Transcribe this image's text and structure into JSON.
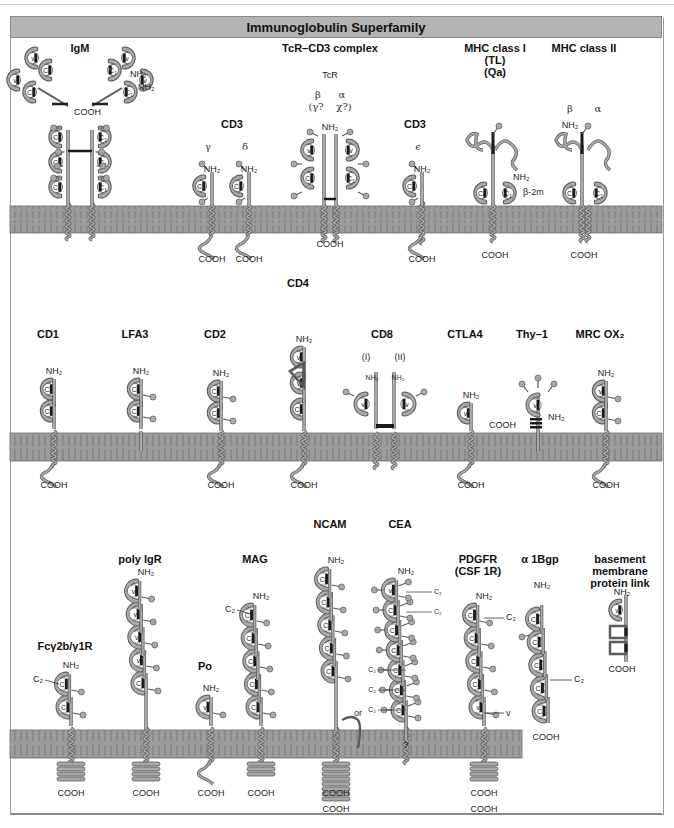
{
  "title": "Immunoglobulin Superfamily",
  "colors": {
    "membrane": "#9c9c9c",
    "membrane_line": "#6e6e6e",
    "chain": "#a8a8a8",
    "chain_outline": "#5a5a5a",
    "disulfide": "#1a1a1a",
    "title_bar": "#b4b4b4"
  },
  "terminal_labels": {
    "n": "NH₂",
    "c": "COOH"
  },
  "rows": [
    {
      "membrane": {
        "x": 10,
        "y": 206,
        "w": 652,
        "h": 27
      },
      "molecules": [
        {
          "id": "igm",
          "name": "IgM",
          "x": 80,
          "label_y": 52,
          "annotations": [
            "NH₂",
            "NH₂",
            "COOH"
          ],
          "domains": [
            "V",
            "V",
            "V",
            "V",
            "C1",
            "C1",
            "C1",
            "C1",
            "C1",
            "C1",
            "C1",
            "C1",
            "C1",
            "C1",
            "C1",
            "C1"
          ]
        },
        {
          "id": "cd3-gamma-delta",
          "name": "CD3",
          "x": 232,
          "label_y": 128,
          "chains": [
            {
              "greek": "γ",
              "x": 208,
              "domains": [
                "C2"
              ]
            },
            {
              "greek": "δ",
              "x": 245,
              "domains": [
                "C2"
              ]
            }
          ]
        },
        {
          "id": "tcr-cd3",
          "name": "TcR–CD3 complex",
          "x": 330,
          "label_y": 52,
          "sublabel": "TcR",
          "greek": [
            "β",
            "α"
          ],
          "greek_alt": [
            "(γ?",
            "χ?)"
          ],
          "domains": [
            "V",
            "V",
            "C1",
            "C1"
          ]
        },
        {
          "id": "cd3-epsilon",
          "name": "CD3",
          "x": 415,
          "label_y": 128,
          "chains": [
            {
              "greek": "ϵ",
              "x": 418,
              "domains": [
                "C2"
              ]
            }
          ]
        },
        {
          "id": "mhc-class-i",
          "name": "MHC class I",
          "name_lines": [
            "MHC class I",
            "(TL)",
            "(Qa)"
          ],
          "x": 495,
          "label_y": 52,
          "domains": [
            "C1",
            "C1"
          ],
          "annotations": [
            "NH₂",
            "β-2m"
          ]
        },
        {
          "id": "mhc-class-ii",
          "name": "MHC class II",
          "x": 584,
          "label_y": 52,
          "greek": [
            "β",
            "α"
          ],
          "domains": [
            "C1",
            "C1"
          ]
        }
      ]
    },
    {
      "membrane": {
        "x": 10,
        "y": 433,
        "w": 652,
        "h": 28
      },
      "molecules": [
        {
          "id": "cd1",
          "name": "CD1",
          "x": 48,
          "label_y": 338,
          "domains": [
            "C1",
            "C1"
          ]
        },
        {
          "id": "lfa3",
          "name": "LFA3",
          "x": 135,
          "label_y": 338,
          "domains": [
            "C1",
            "C1"
          ]
        },
        {
          "id": "cd2",
          "name": "CD2",
          "x": 215,
          "label_y": 338,
          "domains": [
            "C2",
            "C2"
          ]
        },
        {
          "id": "cd4",
          "name": "CD4",
          "x": 298,
          "label_y": 287,
          "domains": [
            "V",
            "V",
            "C2"
          ]
        },
        {
          "id": "cd8",
          "name": "CD8",
          "x": 382,
          "label_y": 338,
          "chain_labels": [
            "(I)",
            "(II)"
          ],
          "domains": [
            "V",
            "V"
          ]
        },
        {
          "id": "ctla4",
          "name": "CTLA4",
          "x": 465,
          "label_y": 338,
          "domains": [
            "V"
          ]
        },
        {
          "id": "thy1",
          "name": "Thy–1",
          "x": 532,
          "label_y": 338,
          "domains": [
            "V"
          ]
        },
        {
          "id": "mrc-ox2",
          "name": "MRC OX₂",
          "x": 600,
          "label_y": 338,
          "domains": [
            "V",
            "C2"
          ]
        }
      ]
    },
    {
      "membrane": {
        "x": 10,
        "y": 730,
        "w": 512,
        "h": 28
      },
      "molecules": [
        {
          "id": "fcg2b-g1r",
          "name": "Fcγ2b/γ1R",
          "x": 65,
          "label_y": 650,
          "domains": [
            "C2",
            "C2"
          ]
        },
        {
          "id": "poly-igr",
          "name": "poly IgR",
          "x": 140,
          "label_y": 563,
          "domains": [
            "V",
            "V",
            "V",
            "V",
            "C2"
          ]
        },
        {
          "id": "po",
          "name": "Po",
          "x": 205,
          "label_y": 670,
          "domains": [
            "V"
          ]
        },
        {
          "id": "mag",
          "name": "MAG",
          "x": 255,
          "label_y": 563,
          "domains": [
            "C2",
            "C2",
            "C2",
            "C2",
            "C2"
          ]
        },
        {
          "id": "ncam",
          "name": "NCAM",
          "x": 330,
          "label_y": 528,
          "domains": [
            "C2",
            "C2",
            "C2",
            "C2",
            "C2"
          ],
          "annotation": "or"
        },
        {
          "id": "cea",
          "name": "CEA",
          "x": 400,
          "label_y": 528,
          "domains": [
            "V",
            "C2",
            "C2",
            "C2",
            "C2",
            "C2",
            "C2"
          ],
          "annotation": "?"
        },
        {
          "id": "pdgfr",
          "name": "PDGFR",
          "name_lines": [
            "PDGFR",
            "(CSF 1R)"
          ],
          "x": 478,
          "label_y": 563,
          "domains": [
            "C2",
            "C2",
            "C2",
            "C2",
            "V"
          ]
        },
        {
          "id": "a1bgp",
          "name": "α 1Bgp",
          "x": 540,
          "label_y": 563,
          "domains": [
            "C2",
            "C2",
            "C2",
            "C2",
            "C2"
          ]
        },
        {
          "id": "bm-link",
          "name": "basement membrane protein link",
          "name_lines": [
            "basement",
            "membrane",
            "protein link"
          ],
          "x": 620,
          "label_y": 563,
          "domains": [
            "V"
          ]
        }
      ]
    }
  ]
}
